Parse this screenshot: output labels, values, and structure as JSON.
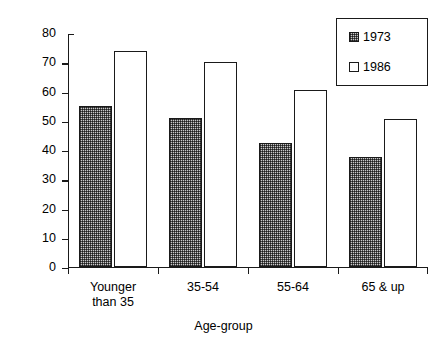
{
  "chart_data": {
    "type": "bar",
    "title": "",
    "xlabel": "Age-group",
    "ylabel": "Percent",
    "categories": [
      "Younger\nthan 35",
      "35-54",
      "55-64",
      "65 & up"
    ],
    "series": [
      {
        "name": "1973",
        "values": [
          55,
          51,
          42.5,
          37.5
        ]
      },
      {
        "name": "1986",
        "values": [
          74,
          70,
          60.5,
          50.5
        ]
      }
    ],
    "ylim": [
      0,
      80
    ],
    "ytick_labels": [
      "80",
      "70",
      "60",
      "50",
      "40",
      "30",
      "20",
      "10",
      "0"
    ],
    "ytick_values": [
      80,
      70,
      60,
      50,
      40,
      30,
      20,
      10,
      0
    ],
    "grid": false,
    "legend_position": "top-right",
    "colors": {
      "series_1973": "#c9c9c9",
      "series_1986": "#ffffff",
      "axis": "#1a1a1a",
      "background": "#ffffff"
    }
  },
  "legend": {
    "entries": [
      {
        "label": "1973",
        "swatch": "hatched-square-icon"
      },
      {
        "label": "1986",
        "swatch": "empty-square-icon"
      }
    ]
  },
  "axes": {
    "y_title": "Percent",
    "x_title": "Age-group"
  }
}
